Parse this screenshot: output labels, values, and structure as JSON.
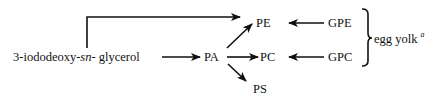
{
  "diagram": {
    "nodes": {
      "start": {
        "prefix": "3-iododeoxy-",
        "italic": "sn",
        "suffix": "- glycerol"
      },
      "pa": "PA",
      "pe": "PE",
      "pc": "PC",
      "ps": "PS",
      "gpe": "GPE",
      "gpc": "GPC",
      "source": {
        "label": "egg yolk",
        "footnote": "a"
      }
    },
    "edges": [
      {
        "from": "3-iododeoxy-sn-glycerol",
        "to": "PE"
      },
      {
        "from": "3-iododeoxy-sn-glycerol",
        "to": "PA"
      },
      {
        "from": "PA",
        "to": "PE"
      },
      {
        "from": "PA",
        "to": "PC"
      },
      {
        "from": "PA",
        "to": "PS"
      },
      {
        "from": "GPE",
        "to": "PE"
      },
      {
        "from": "GPC",
        "to": "PC"
      }
    ],
    "brace_groups": [
      {
        "members": [
          "GPE",
          "GPC"
        ],
        "label": "egg yolk"
      }
    ]
  }
}
